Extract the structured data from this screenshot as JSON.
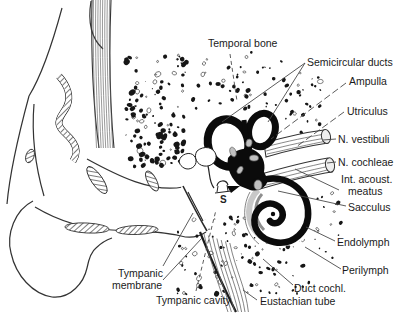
{
  "diagram": {
    "labels": {
      "temporal_bone": "Temporal bone",
      "semicircular_ducts": "Semicircular ducts",
      "ampulla": "Ampulla",
      "utriculus": "Utriculus",
      "n_vestibuli": "N. vestibuli",
      "n_cochleae": "N. cochleae",
      "int_acoust_line1": "Int. acoust.",
      "int_acoust_line2": "meatus",
      "sacculus": "Sacculus",
      "endolymph": "Endolymph",
      "perilymph": "Perilymph",
      "duct_cochl": "Duct cochl.",
      "eustachian_tube": "Eustachian tube",
      "tympanic_cavity": "Tympanic cavity",
      "tympanic_membrane_line1": "Tympanic",
      "tympanic_membrane_line2": "membrane",
      "stapes_marker": "S"
    },
    "colors": {
      "ink": "#1a1a1a",
      "leader": "#4a4a4a",
      "labyrinth_black": "#0b0b0b",
      "perilymph_gray": "#c8c8c8",
      "background": "#ffffff"
    }
  }
}
